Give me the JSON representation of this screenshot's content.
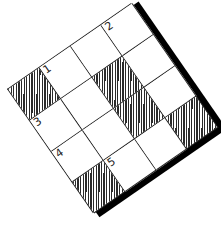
{
  "puzzle": {
    "rows": 4,
    "cols": 4,
    "rotation_deg": -34.7,
    "colors": {
      "line": "#222222",
      "block_hatch": "#2a2a2a",
      "shadow": "#000000",
      "background": "#ffffff"
    },
    "cells": [
      {
        "row": 0,
        "col": 0,
        "block": true,
        "number": ""
      },
      {
        "row": 0,
        "col": 1,
        "block": false,
        "number": "1"
      },
      {
        "row": 0,
        "col": 2,
        "block": false,
        "number": ""
      },
      {
        "row": 0,
        "col": 3,
        "block": false,
        "number": "2"
      },
      {
        "row": 1,
        "col": 0,
        "block": false,
        "number": "3"
      },
      {
        "row": 1,
        "col": 1,
        "block": false,
        "number": ""
      },
      {
        "row": 1,
        "col": 2,
        "block": true,
        "number": ""
      },
      {
        "row": 1,
        "col": 3,
        "block": false,
        "number": ""
      },
      {
        "row": 2,
        "col": 0,
        "block": false,
        "number": "4"
      },
      {
        "row": 2,
        "col": 1,
        "block": false,
        "number": ""
      },
      {
        "row": 2,
        "col": 2,
        "block": true,
        "number": ""
      },
      {
        "row": 2,
        "col": 3,
        "block": false,
        "number": ""
      },
      {
        "row": 3,
        "col": 0,
        "block": true,
        "number": ""
      },
      {
        "row": 3,
        "col": 1,
        "block": false,
        "number": "5"
      },
      {
        "row": 3,
        "col": 2,
        "block": false,
        "number": ""
      },
      {
        "row": 3,
        "col": 3,
        "block": true,
        "number": ""
      }
    ]
  }
}
